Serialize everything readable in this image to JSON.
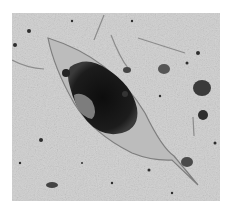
{
  "image": {
    "description": "Grayscale light micrograph of an elongated, leaf-shaped translucent organism (lorica) with a dark central mass and a long tapering tail, on a speckled background with debris and fibers",
    "colors": {
      "background": "#cfcfcf",
      "body": "#b9b9b9",
      "body_edge": "#8a8a8a",
      "dark_mass": "#1a1a1a",
      "inner_light": "#9a9a9a",
      "speck": "#333333"
    }
  }
}
